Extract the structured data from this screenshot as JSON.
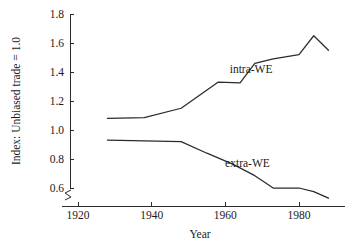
{
  "chart_data": {
    "type": "line",
    "title": "",
    "xlabel": "Year",
    "ylabel": "Index: Unbiased trade = 1.0",
    "xlim": [
      1914,
      1992
    ],
    "ylim": [
      0.5,
      1.8
    ],
    "xticks": [
      1920,
      1940,
      1960,
      1980
    ],
    "xtick_labels": [
      "1920",
      "1940",
      "1960",
      "1980"
    ],
    "yticks": [
      0.6,
      0.8,
      1.0,
      1.2,
      1.4,
      1.6,
      1.8
    ],
    "ytick_labels": [
      "0.6",
      "0.8",
      "1.0",
      "1.2",
      "1.4",
      "1.6",
      "1.8"
    ],
    "grid": false,
    "legend": "inline-annotations",
    "axis_break": {
      "axis": "y",
      "below_value": 0.6,
      "symbol": "zigzag"
    },
    "series": [
      {
        "name": "intra-WE",
        "label_x": 1967,
        "label_y": 1.39,
        "x": [
          1928,
          1938,
          1948,
          1953,
          1958,
          1964,
          1968,
          1973,
          1980,
          1984,
          1988
        ],
        "y": [
          1.08,
          1.085,
          1.15,
          1.24,
          1.33,
          1.325,
          1.46,
          1.49,
          1.52,
          1.65,
          1.55
        ]
      },
      {
        "name": "extra-WE",
        "label_x": 1966,
        "label_y": 0.745,
        "x": [
          1928,
          1938,
          1948,
          1955,
          1962,
          1968,
          1973,
          1980,
          1984,
          1988
        ],
        "y": [
          0.93,
          0.925,
          0.92,
          0.84,
          0.765,
          0.685,
          0.6,
          0.6,
          0.575,
          0.53
        ]
      }
    ]
  }
}
